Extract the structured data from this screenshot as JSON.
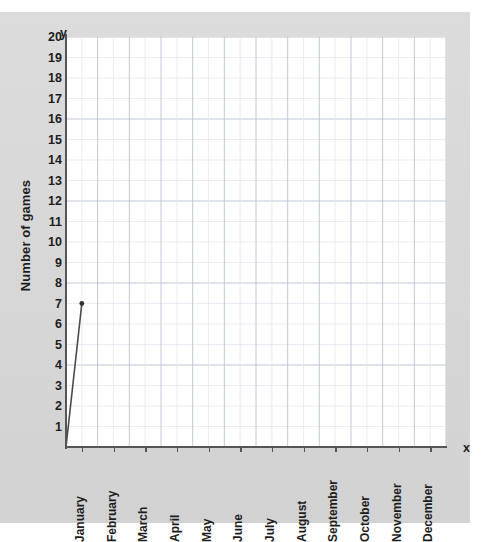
{
  "chart_data": {
    "type": "line",
    "title": "",
    "xlabel": "x",
    "ylabel": "Number of games",
    "y_axis_letter": "y",
    "x_axis_letter": "x",
    "categories": [
      "January",
      "February",
      "March",
      "April",
      "May",
      "June",
      "July",
      "August",
      "September",
      "October",
      "November",
      "December"
    ],
    "y_ticks": [
      20,
      19,
      18,
      17,
      16,
      15,
      14,
      13,
      12,
      11,
      10,
      9,
      8,
      7,
      6,
      5,
      4,
      3,
      2,
      1
    ],
    "ylim": [
      0,
      20
    ],
    "grid": true,
    "legend": "none",
    "series": [
      {
        "name": "Number of games",
        "points": [
          {
            "x": "origin",
            "y": 0
          },
          {
            "x": "January",
            "y": 7
          }
        ],
        "marker_points": [
          {
            "x": "January",
            "y": 7
          }
        ],
        "line_color": "#4a4a4a",
        "marker_color": "#333333"
      }
    ]
  },
  "colors": {
    "panel_background": "#d8d8d8",
    "plot_background": "#ffffff",
    "axis": "#555555",
    "gridline_major": "#b9c3d4",
    "gridline_minor": "#dfe4ec",
    "text": "#1d1d1d"
  }
}
